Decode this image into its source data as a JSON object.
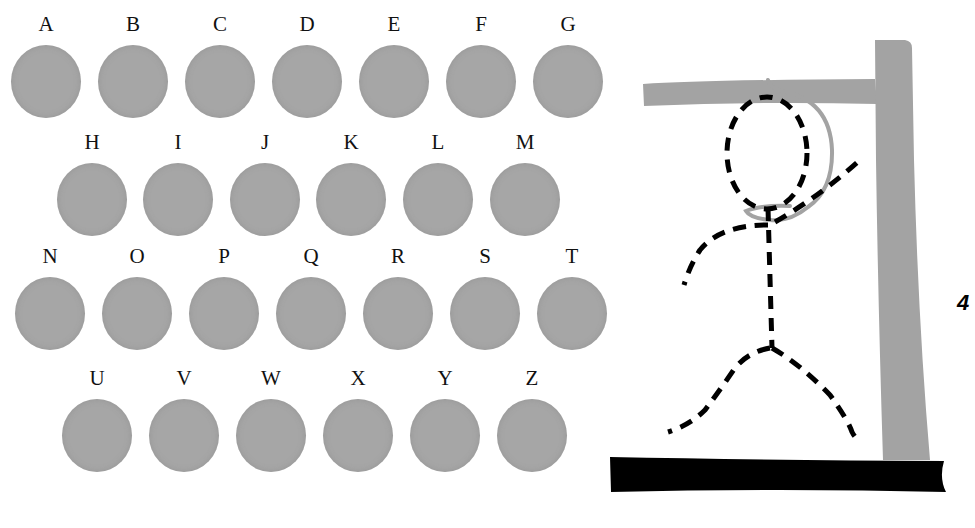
{
  "game": {
    "type": "hangman",
    "wrong_guess_count": "4",
    "colors": {
      "letter_button": "#a6a6a6",
      "gallows": "#a3a3a3",
      "ground": "#000000",
      "figure": "#000000",
      "rope": "#a3a3a3"
    }
  },
  "letter_board": {
    "rows": [
      [
        "A",
        "B",
        "C",
        "D",
        "E",
        "F",
        "G"
      ],
      [
        "H",
        "I",
        "J",
        "K",
        "L",
        "M"
      ],
      [
        "N",
        "O",
        "P",
        "Q",
        "R",
        "S",
        "T"
      ],
      [
        "U",
        "V",
        "W",
        "X",
        "Y",
        "Z"
      ]
    ],
    "letters": {
      "A": "A",
      "B": "B",
      "C": "C",
      "D": "D",
      "E": "E",
      "F": "F",
      "G": "G",
      "H": "H",
      "I": "I",
      "J": "J",
      "K": "K",
      "L": "L",
      "M": "M",
      "N": "N",
      "O": "O",
      "P": "P",
      "Q": "Q",
      "R": "R",
      "S": "S",
      "T": "T",
      "U": "U",
      "V": "V",
      "W": "W",
      "X": "X",
      "Y": "Y",
      "Z": "Z"
    }
  },
  "figure": {
    "parts_drawn": [
      "head",
      "body",
      "left-arm",
      "right-arm",
      "left-leg",
      "right-leg"
    ],
    "style": "dashed"
  }
}
